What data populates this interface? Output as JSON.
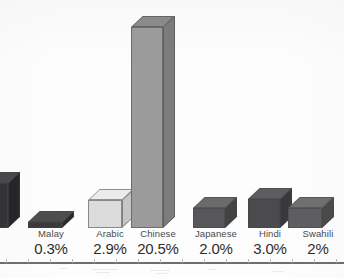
{
  "figure": {
    "background_color": "#fdfdfd",
    "axis_rule_color": "#6e6e72",
    "text_color": "#3b3b3b"
  },
  "chart_data": {
    "type": "bar",
    "title": "",
    "subtitle": "",
    "xlabel": "",
    "ylabel": "",
    "grid": false,
    "legend": "none",
    "style": "3d-isometric-blocks",
    "ylim": [
      0,
      21
    ],
    "note": "Leftmost bar and its label are cropped off the left edge of the frame.",
    "categories": [
      "Malay",
      "Arabic",
      "Chinese",
      "Japanese",
      "Hindi",
      "Swahili"
    ],
    "values": [
      0.3,
      2.9,
      20.5,
      2.0,
      3.0,
      2.0
    ],
    "value_labels": [
      "0.3%",
      "2.9%",
      "20.5%",
      "2.0%",
      "3.0%",
      "2%"
    ],
    "bars": [
      {
        "name": "Malay",
        "value": 0.3,
        "value_label": "0.3%",
        "color": "#3a3a3c",
        "top_color": "#4e4e50",
        "side_color": "#2b2b2d",
        "texture": "solid"
      },
      {
        "name": "Arabic",
        "value": 2.9,
        "value_label": "2.9%",
        "color": "#dcdcdc",
        "top_color": "#ebebeb",
        "side_color": "#c6c6c6",
        "texture": "halftone"
      },
      {
        "name": "Chinese",
        "value": 20.5,
        "value_label": "20.5%",
        "color": "#9b9b9b",
        "top_color": "#8a8a8a",
        "side_color": "#7c7c7c",
        "texture": "halftone"
      },
      {
        "name": "Japanese",
        "value": 2.0,
        "value_label": "2.0%",
        "color": "#57575a",
        "top_color": "#6a6a6d",
        "side_color": "#434346",
        "texture": "solid"
      },
      {
        "name": "Hindi",
        "value": 3.0,
        "value_label": "3.0%",
        "color": "#4b4b4e",
        "top_color": "#5d5d60",
        "side_color": "#39393c",
        "texture": "solid"
      },
      {
        "name": "Swahili",
        "value": 2.0,
        "value_label": "2%",
        "color": "#5e5e61",
        "top_color": "#6f6f72",
        "side_color": "#4a4a4d",
        "texture": "solid"
      }
    ],
    "cropped_bar": {
      "name": "",
      "value_label": "",
      "color": "#343436",
      "top_color": "#48484a",
      "side_color": "#262628"
    }
  }
}
